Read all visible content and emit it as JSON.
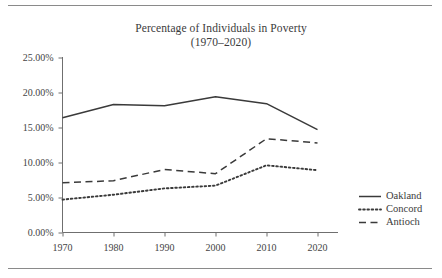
{
  "figure": {
    "title_line1": "Percentage of Individuals in Poverty",
    "title_line2": "(1970–2020)",
    "rule_top_name": "top-divider",
    "rule_bottom_name": "bottom-divider"
  },
  "chart_data": {
    "type": "line",
    "title": "Percentage of Individuals in Poverty (1970–2020)",
    "xlabel": "",
    "ylabel": "",
    "categories": [
      "1970",
      "1980",
      "1990",
      "2000",
      "2010",
      "2020"
    ],
    "x": [
      1970,
      1980,
      1990,
      2000,
      2010,
      2020
    ],
    "xlim": [
      1965,
      2025
    ],
    "ylim": [
      0,
      25
    ],
    "yticks": [
      0,
      5,
      10,
      15,
      20,
      25
    ],
    "ytick_labels": [
      "0.00%",
      "5.00%",
      "10.00%",
      "15.00%",
      "20.00%",
      "25.00%"
    ],
    "xtick_labels": [
      "1970",
      "1980",
      "1990",
      "2000",
      "2010",
      "2020"
    ],
    "grid": false,
    "legend_position": "right",
    "series": [
      {
        "name": "Oakland",
        "style": "solid",
        "color": "#3a3a3a",
        "values": [
          16.4,
          18.3,
          18.1,
          19.4,
          18.4,
          14.7
        ]
      },
      {
        "name": "Concord",
        "style": "dotted",
        "color": "#3a3a3a",
        "values": [
          4.7,
          5.4,
          6.3,
          6.7,
          9.6,
          8.9
        ]
      },
      {
        "name": "Antioch",
        "style": "dashed",
        "color": "#3a3a3a",
        "values": [
          7.1,
          7.4,
          9.0,
          8.4,
          13.4,
          12.8
        ]
      }
    ]
  },
  "legend": {
    "items": [
      {
        "label": "Oakland",
        "style": "solid"
      },
      {
        "label": "Concord",
        "style": "dotted"
      },
      {
        "label": "Antioch",
        "style": "dashed"
      }
    ]
  },
  "axes": {
    "y_labels": [
      "25.00%",
      "20.00%",
      "15.00%",
      "10.00%",
      "5.00%",
      "0.00%"
    ],
    "x_labels": [
      "1970",
      "1980",
      "1990",
      "2000",
      "2010",
      "2020"
    ]
  }
}
